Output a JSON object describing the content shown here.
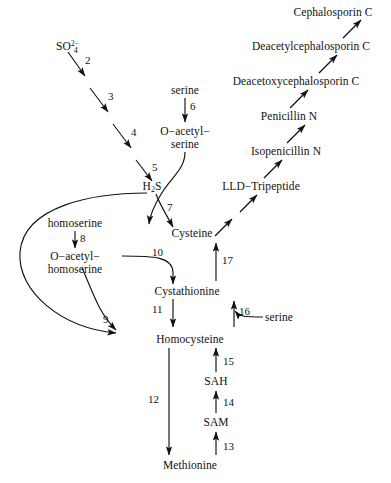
{
  "diagram": {
    "line_color": "#111111",
    "text_color": "#111111",
    "background": "#ffffff"
  },
  "metabolites": {
    "sulfate": "SO",
    "sulfate_sub": "4",
    "sulfate_sup": "2−",
    "serine_top": "serine",
    "o_acetyl_serine_l1": "O−acetyl−",
    "o_acetyl_serine_l2": "serine",
    "h2s_pre": "H",
    "h2s_sub": "2",
    "h2s_post": "S",
    "cysteine": "Cysteine",
    "homoserine": "homoserine",
    "o_acetyl_homoserine_l1": "O−acetyl−",
    "o_acetyl_homoserine_l2": "homoserine",
    "cystathionine": "Cystathionine",
    "serine_mid": "serine",
    "homocysteine": "Homocysteine",
    "sah": "SAH",
    "sam": "SAM",
    "methionine": "Methionine",
    "lld_tripeptide": "LLD−Tripeptide",
    "isopenicillin_n": "Isopenicillin N",
    "penicillin_n": "Penicillin N",
    "deacetoxycephalosporin_c": "Deacetoxycephalosporin C",
    "deacetylcephalosporin_c": "Deacetylcephalosporin C",
    "cephalosporin_c": "Cephalosporin C"
  },
  "step_numbers": {
    "n2": "2",
    "n3": "3",
    "n4": "4",
    "n5": "5",
    "n6": "6",
    "n7": "7",
    "n8": "8",
    "n9": "9",
    "n10": "10",
    "n11": "11",
    "n12": "12",
    "n13": "13",
    "n14": "14",
    "n15": "15",
    "n16": "16",
    "n17": "17"
  }
}
